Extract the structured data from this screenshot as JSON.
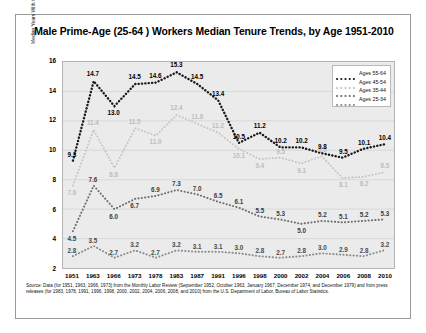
{
  "title": "Male Prime-Age (25-64 ) Workers Median Tenure Trends, by Age 1951-2010",
  "source": "Source: Data (for 1951, 1963, 1966, 1973) from the Monthly Labor Review (September 1952, October 1963, January 1967, December 1974, and December 1979) and from press releases (for 1983, 1978, 1991, 1996, 1998, 2000, 2002, 2004, 2006, 2008, and 2010) from the U.S. Department of Labor, Bureau of Labor Statistics.",
  "chart_data": {
    "type": "line",
    "title": "Male Prime-Age (25-64 ) Workers Median Tenure Trends, by Age 1951-2010",
    "xlabel": "",
    "ylabel": "Median Years With Current Employer",
    "categories": [
      "1951",
      "1963",
      "1966",
      "1973",
      "1978",
      "1983",
      "1987",
      "1991",
      "1996",
      "1998",
      "2000",
      "2002",
      "2004",
      "2006",
      "2008",
      "2010"
    ],
    "ylim": [
      2,
      16
    ],
    "yticks": [
      2,
      4,
      6,
      8,
      10,
      12,
      14,
      16
    ],
    "grid": true,
    "legend_position": "top-right",
    "series": [
      {
        "name": "Ages 25-34",
        "color": "#8c8c8c",
        "values": [
          2.8,
          3.5,
          2.7,
          3.2,
          2.7,
          3.2,
          3.1,
          3.1,
          3.0,
          2.8,
          2.7,
          2.8,
          3.0,
          2.9,
          2.8,
          3.2
        ],
        "label_color": "#4a4a4a"
      },
      {
        "name": "Ages 35-44",
        "color": "#6e6e6e",
        "values": [
          4.5,
          7.6,
          6.0,
          6.7,
          6.9,
          7.3,
          7.0,
          6.5,
          6.1,
          5.5,
          5.3,
          5.0,
          5.2,
          5.1,
          5.2,
          5.3
        ],
        "label_color": "#3c3c3c"
      },
      {
        "name": "Ages 45-54",
        "color": "#c4c4c4",
        "values": [
          7.6,
          11.4,
          8.8,
          11.5,
          11.0,
          12.4,
          11.8,
          11.2,
          10.1,
          9.4,
          9.5,
          9.1,
          9.6,
          8.1,
          8.2,
          8.5
        ],
        "label_color": "#bdbdbd"
      },
      {
        "name": "Ages 55-64",
        "color": "#1a1a1a",
        "values": [
          9.3,
          14.7,
          13.0,
          14.5,
          14.6,
          15.3,
          14.5,
          13.4,
          10.5,
          11.2,
          10.2,
          10.2,
          9.8,
          9.5,
          10.1,
          10.4
        ],
        "label_color": "#000000"
      }
    ]
  }
}
